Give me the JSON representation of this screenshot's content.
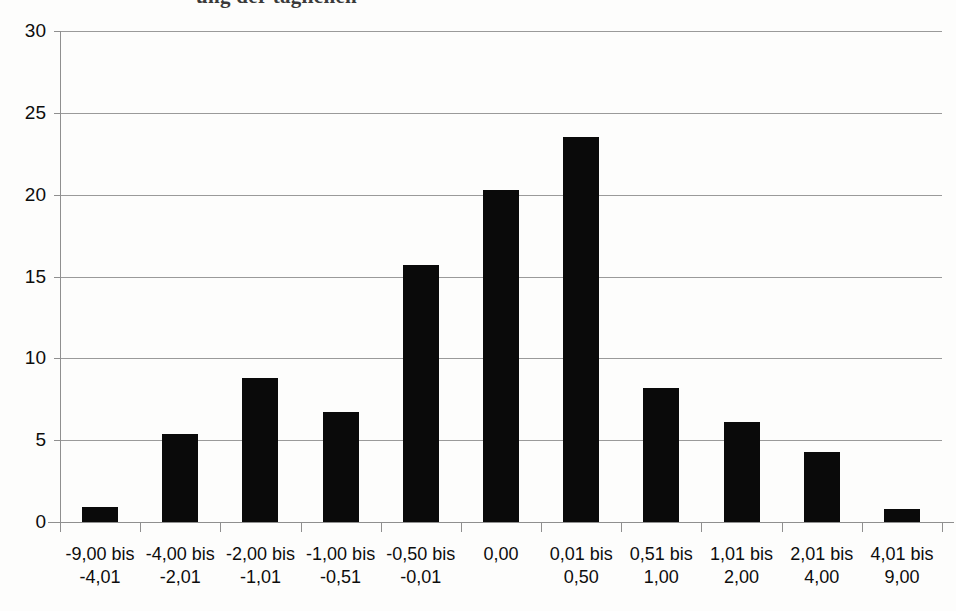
{
  "figure": {
    "cutoff_caption": "ung der täglichen",
    "background_color": "#fdfdfc",
    "bar_color": "#0a0a0a",
    "gridline_color": "#9a9a9a",
    "axis_color": "#8f8f8f"
  },
  "chart_data": {
    "type": "bar",
    "title": "",
    "xlabel": "",
    "ylabel": "",
    "ylim": [
      0,
      30
    ],
    "yticks": [
      0,
      5,
      10,
      15,
      20,
      25,
      30
    ],
    "ytick_labels": [
      "0",
      "5",
      "10",
      "15",
      "20",
      "25",
      "30"
    ],
    "grid": true,
    "legend": "none",
    "categories": [
      "-9,00 bis\n-4,01",
      "-4,00 bis\n-2,01",
      "-2,00 bis\n-1,01",
      "-1,00 bis\n-0,51",
      "-0,50 bis\n-0,01",
      "0,00",
      "0,01 bis\n0,50",
      "0,51 bis\n1,00",
      "1,01 bis\n2,00",
      "2,01 bis\n4,00",
      "4,01 bis\n9,00"
    ],
    "category_lines": [
      [
        "-9,00 bis",
        "-4,01"
      ],
      [
        "-4,00 bis",
        "-2,01"
      ],
      [
        "-2,00 bis",
        "-1,01"
      ],
      [
        "-1,00 bis",
        "-0,51"
      ],
      [
        "-0,50 bis",
        "-0,01"
      ],
      [
        "0,00",
        ""
      ],
      [
        "0,01 bis",
        "0,50"
      ],
      [
        "0,51 bis",
        "1,00"
      ],
      [
        "1,01 bis",
        "2,00"
      ],
      [
        "2,01 bis",
        "4,00"
      ],
      [
        "4,01 bis",
        "9,00"
      ]
    ],
    "values": [
      0.9,
      5.4,
      8.8,
      6.7,
      15.7,
      20.3,
      23.5,
      8.2,
      6.1,
      4.3,
      0.8
    ]
  }
}
